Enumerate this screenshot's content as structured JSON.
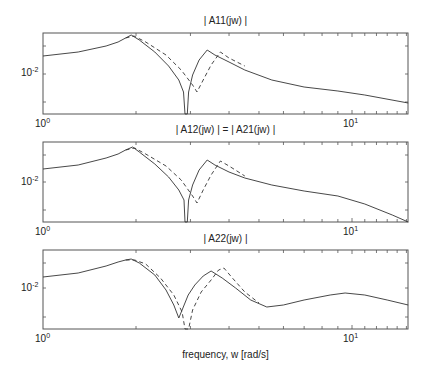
{
  "chart_data": [
    {
      "type": "line",
      "title": "| A11(jw) |",
      "xscale": "log",
      "yscale": "log",
      "xlabel": "",
      "ylabel": "",
      "xlim": [
        1,
        15.2
      ],
      "xticks": [
        "10^0",
        "10^1"
      ],
      "yticks": [
        "10^-2"
      ],
      "series": [
        {
          "name": "solid",
          "style": "solid",
          "points": [
            [
              1.0,
              56
            ],
            [
              1.3,
              52
            ],
            [
              1.6,
              46
            ],
            [
              1.75,
              42
            ],
            [
              1.85,
              38
            ],
            [
              1.93,
              35
            ],
            [
              2.05,
              40
            ],
            [
              2.3,
              52
            ],
            [
              2.55,
              66
            ],
            [
              2.75,
              80
            ],
            [
              2.85,
              92
            ],
            [
              2.88,
              114
            ],
            [
              2.93,
              114
            ],
            [
              2.96,
              92
            ],
            [
              3.05,
              75
            ],
            [
              3.2,
              60
            ],
            [
              3.4,
              50
            ],
            [
              3.6,
              55
            ],
            [
              4.0,
              62
            ],
            [
              4.5,
              70
            ],
            [
              5.5,
              80
            ],
            [
              7.0,
              87
            ],
            [
              9.0,
              91
            ],
            [
              11.0,
              95
            ],
            [
              15.2,
              103
            ]
          ]
        },
        {
          "name": "dashed",
          "style": "dashed",
          "points": [
            [
              1.85,
              38
            ],
            [
              1.97,
              36
            ],
            [
              2.15,
              42
            ],
            [
              2.5,
              55
            ],
            [
              2.8,
              70
            ],
            [
              3.05,
              85
            ],
            [
              3.15,
              92
            ],
            [
              3.3,
              80
            ],
            [
              3.5,
              65
            ],
            [
              3.75,
              52
            ],
            [
              4.0,
              58
            ],
            [
              4.5,
              66
            ]
          ]
        }
      ]
    },
    {
      "type": "line",
      "title": "| A12(jw) |  =  | A21(jw) |",
      "xscale": "log",
      "yscale": "log",
      "xlim": [
        1,
        15.2
      ],
      "xticks": [
        "10^0",
        "10^1"
      ],
      "yticks": [
        "10^-2"
      ],
      "series": [
        {
          "name": "solid",
          "style": "solid",
          "points": [
            [
              1.0,
              169
            ],
            [
              1.3,
              165
            ],
            [
              1.6,
              158
            ],
            [
              1.75,
              154
            ],
            [
              1.85,
              150
            ],
            [
              1.95,
              147
            ],
            [
              2.05,
              152
            ],
            [
              2.3,
              164
            ],
            [
              2.55,
              177
            ],
            [
              2.75,
              190
            ],
            [
              2.86,
              200
            ],
            [
              2.88,
              222
            ],
            [
              2.93,
              222
            ],
            [
              2.96,
              200
            ],
            [
              3.05,
              185
            ],
            [
              3.2,
              170
            ],
            [
              3.4,
              160
            ],
            [
              3.6,
              165
            ],
            [
              4.0,
              172
            ],
            [
              4.5,
              178
            ],
            [
              5.5,
              185
            ],
            [
              7.0,
              191
            ],
            [
              9.0,
              196
            ],
            [
              11.0,
              204
            ],
            [
              13.5,
              215
            ],
            [
              15.2,
              222
            ]
          ]
        },
        {
          "name": "dashed",
          "style": "dashed",
          "points": [
            [
              1.85,
              150
            ],
            [
              1.98,
              148
            ],
            [
              2.15,
              154
            ],
            [
              2.5,
              166
            ],
            [
              2.8,
              180
            ],
            [
              3.05,
              196
            ],
            [
              3.15,
              203
            ],
            [
              3.3,
              190
            ],
            [
              3.5,
              175
            ],
            [
              3.75,
              161
            ],
            [
              4.0,
              166
            ],
            [
              4.5,
              176
            ]
          ]
        }
      ]
    },
    {
      "type": "line",
      "title": "| A22(jw) |",
      "xscale": "log",
      "yscale": "log",
      "xlabel": "frequency, w [rad/s]",
      "xlim": [
        1,
        15.2
      ],
      "xticks": [
        "10^0",
        "10^1"
      ],
      "yticks": [
        "10^-2"
      ],
      "series": [
        {
          "name": "solid",
          "style": "solid",
          "points": [
            [
              1.0,
              277
            ],
            [
              1.3,
              273
            ],
            [
              1.6,
              266
            ],
            [
              1.75,
              262
            ],
            [
              1.85,
              260
            ],
            [
              1.93,
              259
            ],
            [
              2.05,
              263
            ],
            [
              2.3,
              275
            ],
            [
              2.5,
              290
            ],
            [
              2.65,
              305
            ],
            [
              2.75,
              318
            ],
            [
              2.82,
              310
            ],
            [
              2.95,
              295
            ],
            [
              3.1,
              285
            ],
            [
              3.3,
              276
            ],
            [
              3.5,
              271
            ],
            [
              3.8,
              278
            ],
            [
              4.2,
              288
            ],
            [
              4.7,
              300
            ],
            [
              5.3,
              307
            ],
            [
              6.0,
              305
            ],
            [
              7.0,
              300
            ],
            [
              8.5,
              295
            ],
            [
              9.5,
              293
            ],
            [
              11.0,
              295
            ],
            [
              13.0,
              300
            ],
            [
              15.2,
              305
            ]
          ]
        },
        {
          "name": "dashed",
          "style": "dashed",
          "points": [
            [
              1.85,
              260
            ],
            [
              1.98,
              260
            ],
            [
              2.15,
              264
            ],
            [
              2.4,
              278
            ],
            [
              2.65,
              295
            ],
            [
              2.82,
              312
            ],
            [
              2.88,
              329
            ],
            [
              2.96,
              329
            ],
            [
              3.05,
              310
            ],
            [
              3.25,
              292
            ],
            [
              3.5,
              280
            ],
            [
              3.7,
              270
            ],
            [
              3.85,
              268
            ],
            [
              4.1,
              278
            ],
            [
              4.5,
              292
            ],
            [
              5.0,
              303
            ]
          ]
        }
      ]
    }
  ],
  "panels": [
    {
      "title": "| A11(jw) |",
      "ytick": "10",
      "ytick_exp": "-2",
      "xtick0": "10",
      "xtick0_exp": "0",
      "xtick1": "10",
      "xtick1_exp": "1"
    },
    {
      "title": "| A12(jw) |  =  | A21(jw) |",
      "ytick": "10",
      "ytick_exp": "-2",
      "xtick0": "10",
      "xtick0_exp": "0",
      "xtick1": "10",
      "xtick1_exp": "1"
    },
    {
      "title": "| A22(jw) |",
      "ytick": "10",
      "ytick_exp": "-2",
      "xtick0": "10",
      "xtick0_exp": "0",
      "xtick1": "10",
      "xtick1_exp": "1"
    }
  ],
  "xlabel": "frequency, w [rad/s]",
  "colors": {
    "line": "#333333",
    "axes": "#555555"
  }
}
